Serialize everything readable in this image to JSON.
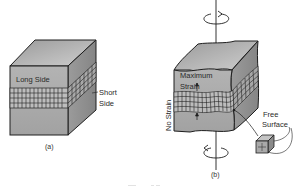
{
  "figure": {
    "panel_a": {
      "caption": "(a)",
      "labels": {
        "long_side": "Long Side",
        "short_side_line1": "Short",
        "short_side_line2": "Side"
      }
    },
    "panel_b": {
      "caption": "(b)",
      "labels": {
        "max_strain_line1": "Maximum",
        "max_strain_line2": "Strain",
        "no_strain": "No Strain",
        "free_surface_line1": "Free",
        "free_surface_line2": "Surface"
      }
    },
    "colors": {
      "face_front": "#a9a9a9",
      "face_top": "#c4c4c4",
      "face_right": "#8f8f8f",
      "grid_band": "#b9b9b9",
      "outline": "#1e1e1e",
      "text": "#2a2a2a"
    }
  }
}
